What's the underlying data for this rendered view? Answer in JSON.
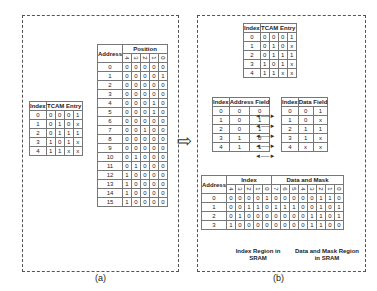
{
  "panel_a": {
    "caption": "(a)",
    "tcam_table": {
      "headers": [
        "Index",
        "TCAM Entry"
      ],
      "rows": [
        [
          "0",
          "0",
          "0",
          "0",
          "1"
        ],
        [
          "1",
          "0",
          "1",
          "0",
          "x"
        ],
        [
          "2",
          "0",
          "1",
          "1",
          "1"
        ],
        [
          "3",
          "1",
          "0",
          "1",
          "x"
        ],
        [
          "4",
          "1",
          "1",
          "x",
          "x"
        ]
      ]
    },
    "address_table": {
      "headers": [
        "Address",
        "Position"
      ],
      "positions": [
        "4",
        "3",
        "2",
        "1",
        "0"
      ],
      "rows": [
        [
          "0",
          "0",
          "0",
          "0",
          "0",
          "0"
        ],
        [
          "1",
          "0",
          "0",
          "0",
          "0",
          "1"
        ],
        [
          "2",
          "0",
          "0",
          "0",
          "0",
          "0"
        ],
        [
          "3",
          "0",
          "0",
          "0",
          "0",
          "0"
        ],
        [
          "4",
          "0",
          "0",
          "0",
          "1",
          "0"
        ],
        [
          "5",
          "0",
          "0",
          "0",
          "1",
          "0"
        ],
        [
          "6",
          "0",
          "0",
          "0",
          "0",
          "0"
        ],
        [
          "7",
          "0",
          "0",
          "1",
          "0",
          "0"
        ],
        [
          "8",
          "0",
          "0",
          "0",
          "0",
          "0"
        ],
        [
          "9",
          "0",
          "0",
          "0",
          "0",
          "0"
        ],
        [
          "10",
          "0",
          "1",
          "0",
          "0",
          "0"
        ],
        [
          "11",
          "0",
          "1",
          "0",
          "0",
          "0"
        ],
        [
          "12",
          "1",
          "0",
          "0",
          "0",
          "0"
        ],
        [
          "13",
          "1",
          "0",
          "0",
          "0",
          "0"
        ],
        [
          "14",
          "1",
          "0",
          "0",
          "0",
          "0"
        ],
        [
          "15",
          "1",
          "0",
          "0",
          "0",
          "0"
        ]
      ]
    }
  },
  "panel_b": {
    "caption": "(b)",
    "tcam_table": {
      "headers": [
        "Index",
        "TCAM Entry"
      ],
      "rows": [
        [
          "0",
          "0",
          "0",
          "0",
          "1"
        ],
        [
          "1",
          "0",
          "1",
          "0",
          "x"
        ],
        [
          "2",
          "0",
          "1",
          "1",
          "1"
        ],
        [
          "3",
          "1",
          "0",
          "1",
          "x"
        ],
        [
          "4",
          "1",
          "1",
          "x",
          "x"
        ]
      ]
    },
    "address_field_table": {
      "headers": [
        "Index",
        "Address Field"
      ],
      "rows": [
        [
          "0",
          "0",
          "0"
        ],
        [
          "1",
          "0",
          "1"
        ],
        [
          "2",
          "0",
          "1"
        ],
        [
          "3",
          "1",
          "0"
        ],
        [
          "4",
          "1",
          "1"
        ]
      ]
    },
    "data_field_table": {
      "headers": [
        "Index",
        "Data Field"
      ],
      "rows": [
        [
          "0",
          "0",
          "1"
        ],
        [
          "1",
          "0",
          "x"
        ],
        [
          "2",
          "1",
          "1"
        ],
        [
          "3",
          "1",
          "x"
        ],
        [
          "4",
          "x",
          "x"
        ]
      ]
    },
    "sram_table": {
      "headers": [
        "Address",
        "Index",
        "Data and Mask"
      ],
      "index_bits": [
        "4",
        "3",
        "2",
        "1",
        "0"
      ],
      "dm_bits": [
        "7",
        "6",
        "5",
        "4",
        "3",
        "2",
        "1",
        "0"
      ],
      "rows": [
        [
          "0",
          "0",
          "0",
          "0",
          "0",
          "1",
          "0",
          "0",
          "0",
          "0",
          "0",
          "1",
          "1",
          "0"
        ],
        [
          "1",
          "0",
          "0",
          "1",
          "1",
          "0",
          "1",
          "1",
          "1",
          "0",
          "0",
          "1",
          "0",
          "1"
        ],
        [
          "2",
          "0",
          "1",
          "0",
          "0",
          "0",
          "0",
          "0",
          "0",
          "0",
          "1",
          "1",
          "0",
          "1"
        ],
        [
          "3",
          "1",
          "0",
          "0",
          "0",
          "0",
          "0",
          "0",
          "0",
          "0",
          "1",
          "1",
          "0",
          "0"
        ]
      ]
    },
    "region_labels": [
      "Index Region in SRAM",
      "Data and Mask Region in SRAM"
    ]
  }
}
